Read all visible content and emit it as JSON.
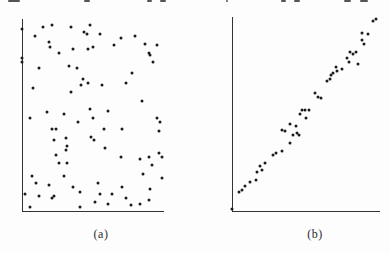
{
  "figure": {
    "background": "#fdfdfd",
    "dot_color": "#1b1b1b",
    "axis_color": "#333333"
  },
  "chart_data": [
    {
      "type": "scatter",
      "label": "(a)",
      "pattern": "random scatter, no correlation",
      "xlabel": "",
      "ylabel": "",
      "x_range": [
        0,
        1
      ],
      "y_range": [
        0,
        1
      ],
      "axes": "plain unlabeled x and y axes, no ticks, no gridlines",
      "points": [
        [
          0.0,
          0.98
        ],
        [
          0.15,
          0.99
        ],
        [
          0.21,
          1.0
        ],
        [
          0.35,
          0.99
        ],
        [
          0.48,
          1.0
        ],
        [
          0.09,
          0.94
        ],
        [
          0.44,
          0.96
        ],
        [
          0.46,
          0.95
        ],
        [
          0.19,
          0.91
        ],
        [
          0.2,
          0.88
        ],
        [
          0.26,
          0.85
        ],
        [
          0.36,
          0.87
        ],
        [
          0.47,
          0.87
        ],
        [
          0.5,
          0.88
        ],
        [
          0.0,
          0.82
        ],
        [
          0.0,
          0.8
        ],
        [
          0.12,
          0.77
        ],
        [
          0.33,
          0.78
        ],
        [
          0.39,
          0.77
        ],
        [
          0.43,
          0.71
        ],
        [
          0.47,
          0.69
        ],
        [
          0.42,
          0.68
        ],
        [
          0.08,
          0.66
        ],
        [
          0.35,
          0.64
        ],
        [
          0.18,
          0.53
        ],
        [
          0.3,
          0.52
        ],
        [
          0.48,
          0.55
        ],
        [
          0.55,
          0.95
        ],
        [
          0.7,
          0.93
        ],
        [
          0.8,
          0.94
        ],
        [
          0.65,
          0.89
        ],
        [
          0.87,
          0.9
        ],
        [
          0.96,
          0.89
        ],
        [
          0.9,
          0.85
        ],
        [
          0.91,
          0.84
        ],
        [
          0.93,
          0.8
        ],
        [
          0.78,
          0.74
        ],
        [
          0.74,
          0.69
        ],
        [
          0.57,
          0.68
        ],
        [
          0.85,
          0.59
        ],
        [
          0.61,
          0.54
        ],
        [
          0.06,
          0.5
        ],
        [
          0.4,
          0.48
        ],
        [
          0.5,
          0.5
        ],
        [
          0.21,
          0.44
        ],
        [
          0.24,
          0.44
        ],
        [
          0.23,
          0.38
        ],
        [
          0.31,
          0.39
        ],
        [
          0.32,
          0.35
        ],
        [
          0.31,
          0.33
        ],
        [
          0.24,
          0.3
        ],
        [
          0.26,
          0.26
        ],
        [
          0.32,
          0.26
        ],
        [
          0.07,
          0.19
        ],
        [
          0.3,
          0.19
        ],
        [
          0.1,
          0.15
        ],
        [
          0.19,
          0.14
        ],
        [
          0.36,
          0.13
        ],
        [
          0.41,
          0.1
        ],
        [
          0.02,
          0.09
        ],
        [
          0.12,
          0.08
        ],
        [
          0.21,
          0.07
        ],
        [
          0.23,
          0.08
        ],
        [
          0.06,
          0.02
        ],
        [
          0.41,
          0.02
        ],
        [
          0.58,
          0.44
        ],
        [
          0.71,
          0.44
        ],
        [
          0.96,
          0.5
        ],
        [
          0.98,
          0.48
        ],
        [
          0.97,
          0.43
        ],
        [
          0.49,
          0.4
        ],
        [
          0.51,
          0.38
        ],
        [
          0.59,
          0.34
        ],
        [
          0.7,
          0.29
        ],
        [
          0.84,
          0.28
        ],
        [
          0.9,
          0.29
        ],
        [
          0.97,
          0.31
        ],
        [
          0.99,
          0.29
        ],
        [
          0.92,
          0.25
        ],
        [
          0.86,
          0.2
        ],
        [
          0.99,
          0.18
        ],
        [
          0.54,
          0.15
        ],
        [
          0.71,
          0.13
        ],
        [
          0.91,
          0.12
        ],
        [
          0.55,
          0.09
        ],
        [
          0.64,
          0.09
        ],
        [
          0.74,
          0.07
        ],
        [
          0.84,
          0.04
        ],
        [
          0.9,
          0.06
        ],
        [
          0.52,
          0.05
        ],
        [
          0.61,
          0.04
        ],
        [
          0.77,
          0.03
        ]
      ]
    },
    {
      "type": "scatter",
      "label": "(b)",
      "pattern": "strong positive linear correlation along the diagonal",
      "xlabel": "",
      "ylabel": "",
      "x_range": [
        0,
        1
      ],
      "y_range": [
        0,
        1
      ],
      "axes": "plain unlabeled x and y axes, no ticks, no gridlines",
      "points": [
        [
          0.0,
          0.01
        ],
        [
          0.05,
          0.1
        ],
        [
          0.07,
          0.11
        ],
        [
          0.09,
          0.13
        ],
        [
          0.12,
          0.15
        ],
        [
          0.16,
          0.16
        ],
        [
          0.17,
          0.2
        ],
        [
          0.19,
          0.23
        ],
        [
          0.2,
          0.21
        ],
        [
          0.22,
          0.25
        ],
        [
          0.28,
          0.29
        ],
        [
          0.3,
          0.3
        ],
        [
          0.34,
          0.31
        ],
        [
          0.39,
          0.35
        ],
        [
          0.34,
          0.42
        ],
        [
          0.36,
          0.41
        ],
        [
          0.39,
          0.45
        ],
        [
          0.43,
          0.44
        ],
        [
          0.41,
          0.39
        ],
        [
          0.44,
          0.4
        ],
        [
          0.45,
          0.39
        ],
        [
          0.46,
          0.5
        ],
        [
          0.47,
          0.52
        ],
        [
          0.49,
          0.52
        ],
        [
          0.52,
          0.52
        ],
        [
          0.5,
          0.48
        ],
        [
          0.56,
          0.61
        ],
        [
          0.58,
          0.59
        ],
        [
          0.6,
          0.58
        ],
        [
          0.64,
          0.67
        ],
        [
          0.66,
          0.68
        ],
        [
          0.67,
          0.7
        ],
        [
          0.68,
          0.71
        ],
        [
          0.7,
          0.74
        ],
        [
          0.71,
          0.72
        ],
        [
          0.74,
          0.73
        ],
        [
          0.79,
          0.77
        ],
        [
          0.78,
          0.79
        ],
        [
          0.8,
          0.82
        ],
        [
          0.82,
          0.81
        ],
        [
          0.84,
          0.82
        ],
        [
          0.85,
          0.76
        ],
        [
          0.88,
          0.92
        ],
        [
          0.92,
          0.91
        ],
        [
          0.88,
          0.88
        ],
        [
          0.89,
          0.86
        ],
        [
          0.95,
          0.98
        ],
        [
          0.97,
          0.99
        ]
      ]
    }
  ]
}
